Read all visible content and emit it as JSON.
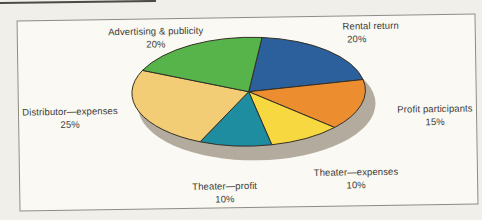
{
  "page": {
    "background_color": "#f1efe9",
    "chart_background": "#faf9f4",
    "frame_border_color": "#8e8b84"
  },
  "chart_data": {
    "type": "pie",
    "title": "",
    "units": "percent",
    "slices": [
      {
        "label": "Rental return",
        "value": 20,
        "pct_label": "20%",
        "color": "#2b609c"
      },
      {
        "label": "Profit participants",
        "value": 15,
        "pct_label": "15%",
        "color": "#ec8e30"
      },
      {
        "label": "Theater—expenses",
        "value": 10,
        "pct_label": "10%",
        "color": "#f8d840"
      },
      {
        "label": "Theater—profit",
        "value": 10,
        "pct_label": "10%",
        "color": "#1e8da0"
      },
      {
        "label": "Distributor—expenses",
        "value": 25,
        "pct_label": "25%",
        "color": "#f3cd76"
      },
      {
        "label": "Advertising & publicity",
        "value": 20,
        "pct_label": "20%",
        "color": "#56b44a"
      }
    ],
    "layout": {
      "style": "3d-tilted-ellipse-with-drop-shadow",
      "start_angle_deg_from_north": 7,
      "clockwise": true,
      "ellipse": {
        "cx": 231,
        "cy": 74.5,
        "rx": 118,
        "ry": 55
      },
      "shadow": {
        "cx": 239,
        "cy": 88,
        "rx": 120,
        "ry": 56,
        "color": "#b3ac9e"
      },
      "stroke_color": "#332f25",
      "legend": "none; radial callout labels around pie"
    }
  }
}
